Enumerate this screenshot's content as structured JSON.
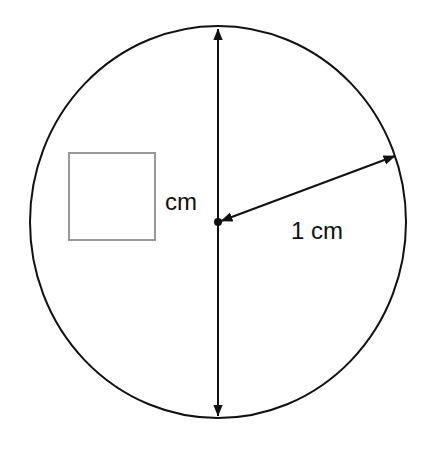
{
  "diagram": {
    "type": "circle-with-diameter-and-radius",
    "colors": {
      "stroke": "#111111",
      "box": "#999999",
      "background": "#ffffff"
    },
    "circle": {
      "cx": 218,
      "cy": 222,
      "rx": 188,
      "ry": 196
    },
    "diameter_arrow": {
      "x": 218,
      "y1": 27,
      "y2": 418,
      "double_headed": true
    },
    "radius_arrow": {
      "x1": 218,
      "y1": 222,
      "x2": 396,
      "y2": 156,
      "double_headed": true
    },
    "center_dot": {
      "x": 218,
      "y": 222
    },
    "answer_box": {
      "x": 69,
      "y": 153,
      "width": 86,
      "height": 87,
      "content": ""
    },
    "labels": {
      "diameter_unit": "cm",
      "radius": "1 cm"
    }
  }
}
